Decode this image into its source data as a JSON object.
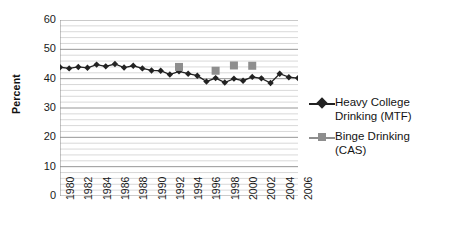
{
  "chart_data": {
    "type": "line",
    "title": "",
    "xlabel": "",
    "ylabel": "Percent",
    "ylim": [
      0,
      60
    ],
    "ytick_values": [
      60,
      50,
      40,
      30,
      20,
      10,
      0
    ],
    "xlim": [
      1980,
      2006
    ],
    "xtick_labels": [
      "1980",
      "1982",
      "1984",
      "1986",
      "1988",
      "1990",
      "1992",
      "1994",
      "1996",
      "1998",
      "2000",
      "2002",
      "2004",
      "2006"
    ],
    "grid": "horizontal-major-and-minor",
    "minor_gridline_step": 2,
    "legend_position": "right",
    "series": [
      {
        "name": "Heavy College Drinking (MTF)",
        "marker": "diamond",
        "color": "#222222",
        "x": [
          1980,
          1981,
          1982,
          1983,
          1984,
          1985,
          1986,
          1987,
          1988,
          1989,
          1990,
          1991,
          1992,
          1993,
          1994,
          1995,
          1996,
          1997,
          1998,
          1999,
          2000,
          2001,
          2002,
          2003,
          2004,
          2005,
          2006
        ],
        "values": [
          43.9,
          43.5,
          44.0,
          43.7,
          44.8,
          44.2,
          45.0,
          43.8,
          44.4,
          43.5,
          42.8,
          42.7,
          41.4,
          42.5,
          41.7,
          41.0,
          39.0,
          40.2,
          38.7,
          40.0,
          39.3,
          40.6,
          40.1,
          38.5,
          41.7,
          40.5,
          40.2
        ]
      },
      {
        "name": "Binge Drinking (CAS)",
        "marker": "square",
        "color": "#8e8e8e",
        "x": [
          1993,
          1997,
          1999,
          2001
        ],
        "values": [
          44.0,
          42.7,
          44.5,
          44.4
        ]
      }
    ],
    "legend": [
      {
        "label_line1": "Heavy College",
        "label_line2": "Drinking (MTF)",
        "marker": "diamond",
        "color": "#222222"
      },
      {
        "label_line1": "Binge Drinking",
        "label_line2": "(CAS)",
        "marker": "square",
        "color": "#8e8e8e"
      }
    ]
  }
}
